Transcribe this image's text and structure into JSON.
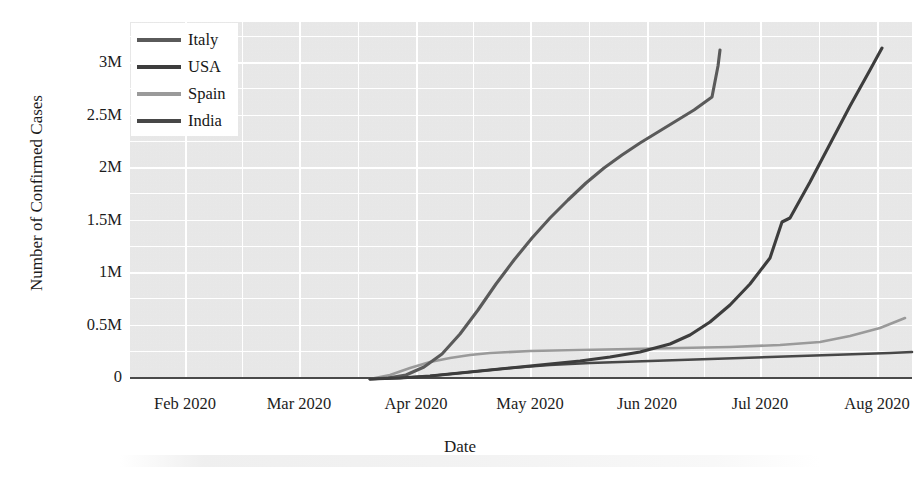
{
  "chart_data": {
    "type": "line",
    "title": "",
    "xlabel": "Date",
    "ylabel": "Number of Confirmed Cases",
    "grid": true,
    "legend_position": "top-left",
    "x_tick_labels": [
      "Feb 2020",
      "Mar 2020",
      "Apr 2020",
      "May 2020",
      "Jun 2020",
      "Jul 2020",
      "Aug 2020"
    ],
    "y_tick_labels": [
      "3M",
      "2.5M",
      "2M",
      "1.5M",
      "1M",
      "0.5M",
      "0"
    ],
    "y_tick_values": [
      3000000,
      2500000,
      2000000,
      1500000,
      1000000,
      500000,
      0
    ],
    "ylim": [
      0,
      3350000
    ],
    "xlim": [
      "2020-01-22",
      "2020-09-05"
    ],
    "series": [
      {
        "name": "Italy",
        "color": "#5a5a5a",
        "x": [
          "2020-02-01",
          "2020-03-01",
          "2020-03-15",
          "2020-04-01",
          "2020-04-15",
          "2020-05-01",
          "2020-05-15",
          "2020-06-01",
          "2020-06-15",
          "2020-07-01",
          "2020-07-15",
          "2020-08-01",
          "2020-08-15",
          "2020-09-01"
        ],
        "values": [
          0,
          1700,
          24700,
          110600,
          165200,
          205500,
          223900,
          233000,
          237000,
          240900,
          243700,
          248200,
          253900,
          270000
        ]
      },
      {
        "name": "USA",
        "color": "#3d3d3d",
        "x": [
          "2020-02-01",
          "2020-03-01",
          "2020-03-15",
          "2020-04-01",
          "2020-04-15",
          "2020-05-01",
          "2020-05-15",
          "2020-06-01",
          "2020-06-15",
          "2020-07-01",
          "2020-07-15",
          "2020-08-01",
          "2020-08-15",
          "2020-09-01"
        ],
        "values": [
          8,
          75,
          3500,
          213000,
          636000,
          1103000,
          1417000,
          1790000,
          2115000,
          2686000,
          3431000,
          4542000,
          5361000,
          6000000
        ]
      },
      {
        "name": "Spain",
        "color": "#9a9a9a",
        "x": [
          "2020-02-01",
          "2020-03-01",
          "2020-03-15",
          "2020-04-01",
          "2020-04-15",
          "2020-05-01",
          "2020-05-15",
          "2020-06-01",
          "2020-06-15",
          "2020-07-01",
          "2020-07-15",
          "2020-08-01",
          "2020-08-15",
          "2020-09-01"
        ],
        "values": [
          0,
          84,
          7800,
          104100,
          177600,
          213400,
          230000,
          239600,
          244100,
          250000,
          258000,
          294000,
          359000,
          405000
        ]
      },
      {
        "name": "India",
        "color": "#474747",
        "x": [
          "2020-02-01",
          "2020-03-01",
          "2020-03-15",
          "2020-04-01",
          "2020-04-15",
          "2020-05-01",
          "2020-05-15",
          "2020-06-01",
          "2020-06-15",
          "2020-07-01",
          "2020-07-15",
          "2020-08-01",
          "2020-08-15",
          "2020-09-01"
        ],
        "values": [
          1,
          3,
          110,
          1998,
          12370,
          35000,
          85000,
          190000,
          332000,
          585000,
          970000,
          1700000,
          2590000,
          3700000
        ]
      }
    ],
    "rendered_curves": {
      "note": "Pixel-traced polylines as drawn in the figure panel (panel coords, 782x357, y=0 top).",
      "italy_like_steep": [
        [
          240,
          357
        ],
        [
          258,
          356
        ],
        [
          276,
          353
        ],
        [
          294,
          345
        ],
        [
          312,
          332
        ],
        [
          330,
          312
        ],
        [
          348,
          288
        ],
        [
          366,
          262
        ],
        [
          384,
          238
        ],
        [
          402,
          216
        ],
        [
          420,
          196
        ],
        [
          438,
          178
        ],
        [
          456,
          161
        ],
        [
          474,
          146
        ],
        [
          492,
          133
        ],
        [
          510,
          121
        ],
        [
          528,
          110
        ],
        [
          546,
          99
        ],
        [
          564,
          88
        ],
        [
          582,
          75
        ],
        [
          588,
          44
        ],
        [
          590,
          28
        ]
      ],
      "usa_like_exp": [
        [
          240,
          357
        ],
        [
          270,
          356
        ],
        [
          300,
          354
        ],
        [
          330,
          351
        ],
        [
          360,
          348
        ],
        [
          390,
          345
        ],
        [
          420,
          342
        ],
        [
          450,
          339
        ],
        [
          480,
          335
        ],
        [
          510,
          330
        ],
        [
          540,
          322
        ],
        [
          560,
          313
        ],
        [
          580,
          300
        ],
        [
          600,
          283
        ],
        [
          620,
          262
        ],
        [
          640,
          236
        ],
        [
          652,
          200
        ],
        [
          660,
          196
        ],
        [
          680,
          160
        ],
        [
          700,
          122
        ],
        [
          720,
          84
        ],
        [
          740,
          48
        ],
        [
          752,
          26
        ]
      ],
      "spain_like_flat": [
        [
          240,
          357
        ],
        [
          260,
          353
        ],
        [
          280,
          346
        ],
        [
          300,
          340
        ],
        [
          320,
          336
        ],
        [
          340,
          333
        ],
        [
          360,
          331
        ],
        [
          400,
          329
        ],
        [
          450,
          328
        ],
        [
          500,
          327
        ],
        [
          550,
          326
        ],
        [
          600,
          325
        ],
        [
          650,
          323
        ],
        [
          690,
          320
        ],
        [
          720,
          314
        ],
        [
          750,
          306
        ],
        [
          775,
          296
        ]
      ],
      "india_like_flat": [
        [
          240,
          357
        ],
        [
          270,
          356
        ],
        [
          300,
          354
        ],
        [
          340,
          350
        ],
        [
          380,
          346
        ],
        [
          420,
          343
        ],
        [
          460,
          341
        ],
        [
          520,
          339
        ],
        [
          580,
          337
        ],
        [
          640,
          335
        ],
        [
          700,
          333
        ],
        [
          760,
          331
        ],
        [
          782,
          330
        ]
      ]
    }
  },
  "axis": {
    "y_title": "Number of Confirmed Cases",
    "x_title": "Date"
  },
  "legend": {
    "entries": [
      {
        "label": "Italy",
        "color": "#5a5a5a"
      },
      {
        "label": "USA",
        "color": "#3d3d3d"
      },
      {
        "label": "Spain",
        "color": "#9a9a9a"
      },
      {
        "label": "India",
        "color": "#474747"
      }
    ]
  },
  "theme": {
    "panel_background": "#ebebeb",
    "gridline_color": "#ffffff",
    "page_background": "#ffffff",
    "text_color": "#1c1c1c",
    "axis_line_color": "#4a4a4a"
  }
}
